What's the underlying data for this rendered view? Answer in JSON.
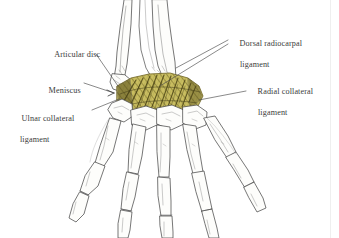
{
  "figure": {
    "background_color": "#ffffff",
    "line_color": "#4a4a4a",
    "text_color": "#3b3b3b",
    "highlight_color": "#c9bd5f",
    "highlight_shade_color": "#6e6324",
    "bone_fill_color": "#fdfdfb"
  },
  "annotations": [
    {
      "id": "articular-disc",
      "line1": "Articular disc",
      "line2": "",
      "x": 46,
      "y": 44
    },
    {
      "id": "meniscus",
      "line1": "Meniscus",
      "line2": "",
      "x": 40,
      "y": 80
    },
    {
      "id": "ulnar-collateral-ligament",
      "line1": "Ulnar collateral",
      "line2": "ligament",
      "x": 13,
      "y": 108
    },
    {
      "id": "dorsal-radiocarpal-ligament",
      "line1": "Dorsal radiocarpal",
      "line2": "ligament",
      "x": 231,
      "y": 33
    },
    {
      "id": "radial-collateral-ligament",
      "line1": "Radial collateral",
      "line2": "ligament",
      "x": 249,
      "y": 81
    }
  ],
  "structures": [
    {
      "id": "radius",
      "label": "radius"
    },
    {
      "id": "ulna",
      "label": "ulna"
    },
    {
      "id": "carpal-bones",
      "label": "carpal bones"
    },
    {
      "id": "metacarpals",
      "label": "metacarpals"
    },
    {
      "id": "phalanges",
      "label": "phalanges"
    },
    {
      "id": "dorsal-ligament-sheet",
      "label": "dorsal ligament sheet"
    }
  ]
}
